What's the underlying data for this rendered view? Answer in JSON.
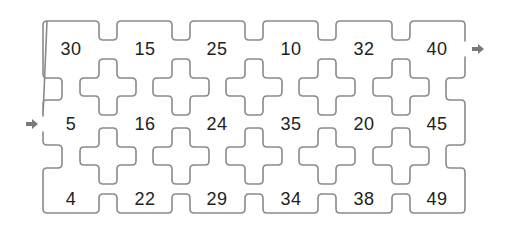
{
  "puzzle": {
    "type": "maze-number-grid",
    "rows": 3,
    "columns": 6,
    "cells": [
      [
        30,
        15,
        25,
        10,
        32,
        40
      ],
      [
        5,
        16,
        24,
        35,
        20,
        45
      ],
      [
        4,
        22,
        29,
        34,
        38,
        49
      ]
    ],
    "entry": {
      "label": "start-arrow",
      "row": 1,
      "side": "left"
    },
    "exit": {
      "label": "end-arrow",
      "row": 0,
      "side": "right"
    }
  },
  "labels": {
    "r0c0": "30",
    "r0c1": "15",
    "r0c2": "25",
    "r0c3": "10",
    "r0c4": "32",
    "r0c5": "40",
    "r1c0": "5",
    "r1c1": "16",
    "r1c2": "24",
    "r1c3": "35",
    "r1c4": "20",
    "r1c5": "45",
    "r2c0": "4",
    "r2c1": "22",
    "r2c2": "29",
    "r2c3": "34",
    "r2c4": "38",
    "r2c5": "49"
  },
  "colors": {
    "outline": "#8a8a8a",
    "text": "#222222",
    "arrow": "#7a7a7a",
    "background": "#ffffff"
  }
}
